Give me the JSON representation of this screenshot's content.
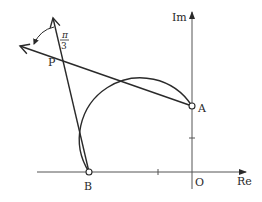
{
  "diagram": {
    "type": "argand-diagram",
    "axes": {
      "real_label": "Re",
      "imag_label": "Im",
      "origin_label": "O"
    },
    "points": [
      {
        "id": "A",
        "label": "A",
        "description": "on imaginary axis, open circle"
      },
      {
        "id": "B",
        "label": "B",
        "description": "on real axis, open circle"
      },
      {
        "id": "P",
        "label": "P",
        "description": "intersection point on arc"
      }
    ],
    "angle": {
      "label_numerator": "π",
      "label_denominator": "3",
      "description": "angle between rays PA-extended and PB-extended at P"
    },
    "elements": [
      "circular arc from A through P to B",
      "ray from A through P",
      "ray from B through P"
    ],
    "colors": {
      "line": "#2a2a2a",
      "axis": "#555555",
      "background": "#ffffff"
    }
  }
}
